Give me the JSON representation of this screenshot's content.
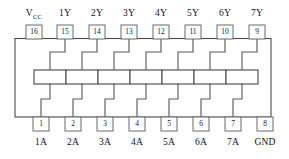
{
  "diagram": {
    "package": "DIP-16",
    "gate_count": 7,
    "colors": {
      "background": "#ffffff",
      "outline": "#4a4a4a",
      "wire": "#555555",
      "pin_box_stroke": "#6b6b6b",
      "text": "#111111"
    },
    "top_pins": [
      {
        "number": "16",
        "label": "V",
        "label_sub": "CC",
        "label_full": "VCC"
      },
      {
        "number": "15",
        "label": "1Y",
        "label_sub": "",
        "label_full": "1Y"
      },
      {
        "number": "14",
        "label": "2Y",
        "label_sub": "",
        "label_full": "2Y"
      },
      {
        "number": "13",
        "label": "3Y",
        "label_sub": "",
        "label_full": "3Y"
      },
      {
        "number": "12",
        "label": "4Y",
        "label_sub": "",
        "label_full": "4Y"
      },
      {
        "number": "11",
        "label": "5Y",
        "label_sub": "",
        "label_full": "5Y"
      },
      {
        "number": "10",
        "label": "6Y",
        "label_sub": "",
        "label_full": "6Y"
      },
      {
        "number": "9",
        "label": "7Y",
        "label_sub": "",
        "label_full": "7Y"
      }
    ],
    "bottom_pins": [
      {
        "number": "1",
        "label": "1A",
        "label_full": "1A"
      },
      {
        "number": "2",
        "label": "2A",
        "label_full": "2A"
      },
      {
        "number": "3",
        "label": "3A",
        "label_full": "3A"
      },
      {
        "number": "4",
        "label": "4A",
        "label_full": "4A"
      },
      {
        "number": "5",
        "label": "5A",
        "label_full": "5A"
      },
      {
        "number": "6",
        "label": "6A",
        "label_full": "6A"
      },
      {
        "number": "7",
        "label": "7A",
        "label_full": "7A"
      },
      {
        "number": "8",
        "label": "GND",
        "label_full": "GND"
      }
    ],
    "gates": [
      {
        "id": "gate-1",
        "input_pin": "1",
        "output_pin": "15"
      },
      {
        "id": "gate-2",
        "input_pin": "2",
        "output_pin": "14"
      },
      {
        "id": "gate-3",
        "input_pin": "3",
        "output_pin": "13"
      },
      {
        "id": "gate-4",
        "input_pin": "4",
        "output_pin": "12"
      },
      {
        "id": "gate-5",
        "input_pin": "5",
        "output_pin": "11"
      },
      {
        "id": "gate-6",
        "input_pin": "6",
        "output_pin": "10"
      },
      {
        "id": "gate-7",
        "input_pin": "7",
        "output_pin": "9"
      }
    ]
  }
}
